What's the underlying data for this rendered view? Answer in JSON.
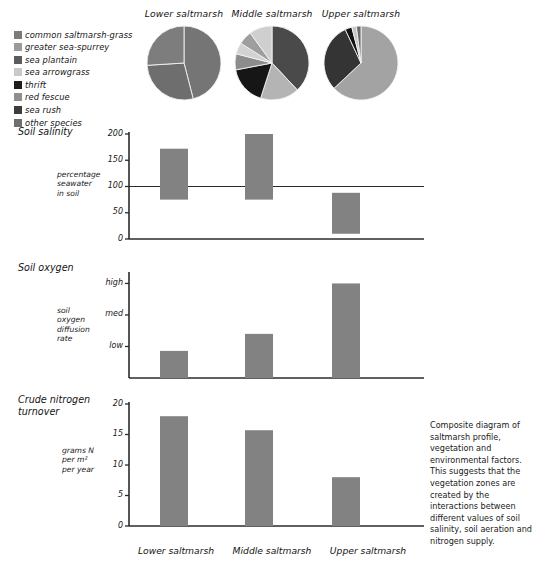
{
  "legend": {
    "items": [
      {
        "label": "common saltmarsh-grass",
        "color": "#7b7b7b"
      },
      {
        "label": "greater sea-spurrey",
        "color": "#9a9a9a"
      },
      {
        "label": "sea plantain",
        "color": "#5c5c5c"
      },
      {
        "label": "sea arrowgrass",
        "color": "#c9c9c9"
      },
      {
        "label": "thrift",
        "color": "#1d1d1d"
      },
      {
        "label": "red fescue",
        "color": "#8f8f8f"
      },
      {
        "label": "sea rush",
        "color": "#3d3d3d"
      },
      {
        "label": "other species",
        "color": "#6f6f6f"
      }
    ]
  },
  "pies": {
    "titles": [
      "Lower saltmarsh",
      "Middle saltmarsh",
      "Upper saltmarsh"
    ],
    "charts": [
      {
        "name": "Lower saltmarsh",
        "slices": [
          {
            "species": "common saltmarsh-grass",
            "value": 46,
            "color": "#757575"
          },
          {
            "species": "greater sea-spurrey",
            "value": 28,
            "color": "#6e6e6e"
          },
          {
            "species": "other species",
            "value": 26,
            "color": "#7d7d7d"
          }
        ]
      },
      {
        "name": "Middle saltmarsh",
        "slices": [
          {
            "species": "sea plantain",
            "value": 38,
            "color": "#4a4a4a"
          },
          {
            "species": "sea arrowgrass",
            "value": 17,
            "color": "#b4b4b4"
          },
          {
            "species": "thrift",
            "value": 17,
            "color": "#161616"
          },
          {
            "species": "red fescue",
            "value": 7,
            "color": "#8c8c8c"
          },
          {
            "species": "common saltmarsh-grass",
            "value": 5,
            "color": "#d2d2d2"
          },
          {
            "species": "greater sea-spurrey",
            "value": 6,
            "color": "#9e9e9e"
          },
          {
            "species": "other species",
            "value": 10,
            "color": "#cfcfcf"
          }
        ]
      },
      {
        "name": "Upper saltmarsh",
        "slices": [
          {
            "species": "red fescue",
            "value": 63,
            "color": "#a3a3a3"
          },
          {
            "species": "sea rush",
            "value": 30,
            "color": "#343434"
          },
          {
            "species": "thrift",
            "value": 3,
            "color": "#121212"
          },
          {
            "species": "sea arrowgrass",
            "value": 2,
            "color": "#c5c5c5"
          },
          {
            "species": "other species",
            "value": 2,
            "color": "#6b6b6b"
          }
        ]
      }
    ]
  },
  "charts": [
    {
      "title": "Soil salinity",
      "axis_caption": "percentage\nseawater\nin soil",
      "type": "range-bar",
      "categories": [
        "Lower saltmarsh",
        "Middle saltmarsh",
        "Upper saltmarsh"
      ],
      "ticks": [
        "0",
        "50",
        "100",
        "150",
        "200"
      ],
      "tick_values": [
        0,
        50,
        100,
        150,
        200
      ],
      "ylim": [
        0,
        200
      ],
      "reference_line": 100,
      "ranges": [
        {
          "low": 75,
          "high": 172
        },
        {
          "low": 75,
          "high": 200
        },
        {
          "low": 10,
          "high": 88
        }
      ],
      "bar_color": "#828282"
    },
    {
      "title": "Soil oxygen",
      "axis_caption": "soil\noxygen\ndiffusion\nrate",
      "type": "bar",
      "categories": [
        "Lower saltmarsh",
        "Middle saltmarsh",
        "Upper saltmarsh"
      ],
      "ticks": [
        "low",
        "med",
        "high"
      ],
      "tick_values": [
        1,
        2,
        3
      ],
      "ylim": [
        0,
        3.3
      ],
      "values": [
        0.86,
        1.4,
        3.0
      ],
      "bar_color": "#828282"
    },
    {
      "title": "Crude nitrogen\nturnover",
      "axis_caption": "grams N\nper m²\nper year",
      "type": "bar",
      "categories": [
        "Lower saltmarsh",
        "Middle saltmarsh",
        "Upper saltmarsh"
      ],
      "ticks": [
        "0",
        "5",
        "10",
        "15",
        "20"
      ],
      "tick_values": [
        0,
        5,
        10,
        15,
        20
      ],
      "ylim": [
        0,
        20
      ],
      "values": [
        18.0,
        15.7,
        8.0
      ],
      "bar_color": "#828282"
    }
  ],
  "x_axis_labels": [
    "Lower saltmarsh",
    "Middle saltmarsh",
    "Upper saltmarsh"
  ],
  "caption": "Composite diagram of saltmarsh profile, vegetation and environmental factors. This suggests that the vegetation zones are created by the interactions between different values of soil salinity, soil aeration and nitrogen supply.",
  "chart_data": [
    {
      "type": "pie",
      "title": "Lower saltmarsh",
      "labels": [
        "common saltmarsh-grass",
        "greater sea-spurrey",
        "other species"
      ],
      "values": [
        46,
        28,
        26
      ],
      "legend": "external"
    },
    {
      "type": "pie",
      "title": "Middle saltmarsh",
      "labels": [
        "sea plantain",
        "sea arrowgrass",
        "thrift",
        "red fescue",
        "common saltmarsh-grass",
        "greater sea-spurrey",
        "other species"
      ],
      "values": [
        38,
        17,
        17,
        7,
        5,
        6,
        10
      ],
      "legend": "external"
    },
    {
      "type": "pie",
      "title": "Upper saltmarsh",
      "labels": [
        "red fescue",
        "sea rush",
        "thrift",
        "sea arrowgrass",
        "other species"
      ],
      "values": [
        63,
        30,
        3,
        2,
        2
      ],
      "legend": "external"
    },
    {
      "type": "bar",
      "title": "Soil salinity",
      "categories": [
        "Lower saltmarsh",
        "Middle saltmarsh",
        "Upper saltmarsh"
      ],
      "series": [
        {
          "name": "low",
          "values": [
            75,
            75,
            10
          ]
        },
        {
          "name": "high",
          "values": [
            172,
            200,
            88
          ]
        }
      ],
      "ylabel": "percentage seawater in soil",
      "xlabel": "",
      "ylim": [
        0,
        200
      ],
      "yticks": [
        0,
        50,
        100,
        150,
        200
      ],
      "annotations": [
        "reference line at 100"
      ],
      "grid": false,
      "legend": "none"
    },
    {
      "type": "bar",
      "title": "Soil oxygen",
      "categories": [
        "Lower saltmarsh",
        "Middle saltmarsh",
        "Upper saltmarsh"
      ],
      "values": [
        0.86,
        1.4,
        3.0
      ],
      "ylabel": "soil oxygen diffusion rate",
      "xlabel": "",
      "ylim": [
        0,
        3.3
      ],
      "yticks": [
        1,
        2,
        3
      ],
      "ytick_labels": [
        "low",
        "med",
        "high"
      ],
      "grid": false,
      "legend": "none"
    },
    {
      "type": "bar",
      "title": "Crude nitrogen turnover",
      "categories": [
        "Lower saltmarsh",
        "Middle saltmarsh",
        "Upper saltmarsh"
      ],
      "values": [
        18.0,
        15.7,
        8.0
      ],
      "ylabel": "grams N per m² per year",
      "xlabel": "",
      "ylim": [
        0,
        20
      ],
      "yticks": [
        0,
        5,
        10,
        15,
        20
      ],
      "grid": false,
      "legend": "none"
    }
  ]
}
